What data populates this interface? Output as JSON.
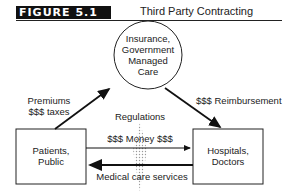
{
  "figure": {
    "label": "FIGURE 5.1",
    "title": "Third Party Contracting"
  },
  "nodes": {
    "insurer": {
      "line1": "Insurance,",
      "line2": "Government",
      "line3": "Managed",
      "line4": "Care"
    },
    "patients": {
      "line1": "Patients,",
      "line2": "Public"
    },
    "providers": {
      "line1": "Hospitals,",
      "line2": "Doctors"
    }
  },
  "edges": {
    "premiums": {
      "line1": "Premiums",
      "line2": "$$$ taxes"
    },
    "reimbursement": "$$$ Reimbursement",
    "regulations": "Regulations",
    "money": "$$$ Money $$$",
    "services": "Medical care services"
  }
}
